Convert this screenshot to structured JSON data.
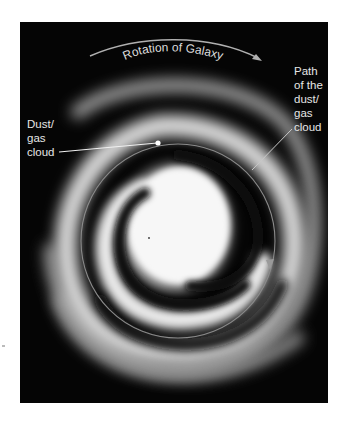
{
  "diagram": {
    "background_color": "#050505",
    "labels": {
      "rotation": "Rotation of Galaxy",
      "cloud": [
        "Dust/",
        "gas",
        "cloud"
      ],
      "path": [
        "Path",
        "of the",
        "dust/",
        "gas",
        "cloud"
      ]
    },
    "colors": {
      "label_text": "#e6e6e6",
      "leader_line": "#f0f0f0",
      "orbit_path": "#8a8a8a",
      "rotation_arrow": "#b0b0b0",
      "galaxy_glow": "#ffffff"
    },
    "elements": [
      {
        "name": "galaxy-core",
        "kind": "bright bulge"
      },
      {
        "name": "inner-spiral-arm",
        "kind": "arm"
      },
      {
        "name": "outer-spiral-arm",
        "kind": "arm"
      },
      {
        "name": "dust-gas-cloud-marker",
        "kind": "point"
      },
      {
        "name": "orbit-path",
        "kind": "circular path with direction arrow",
        "direction": "clockwise"
      },
      {
        "name": "rotation-arrow",
        "kind": "curved arrow",
        "direction": "clockwise"
      }
    ]
  }
}
